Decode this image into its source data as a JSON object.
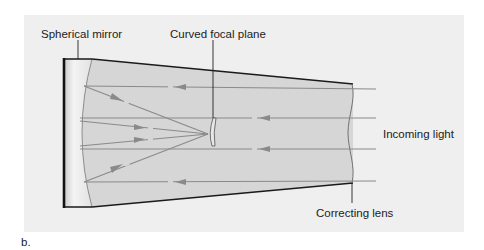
{
  "figure": {
    "panel_label": "b.",
    "labels": {
      "spherical_mirror": "Spherical mirror",
      "curved_focal_plane": "Curved focal plane",
      "incoming_light": "Incoming light",
      "correcting_lens": "Correcting lens"
    },
    "colors": {
      "panel_background": "#efefef",
      "tube_fill": "#d6d6d6",
      "mirror_region": "#e8e8e8",
      "outline": "#1a1a1a",
      "ray": "#8a8a8a",
      "text": "#222222"
    },
    "icons": {
      "arrowhead": "triangle-arrowhead-icon"
    }
  }
}
